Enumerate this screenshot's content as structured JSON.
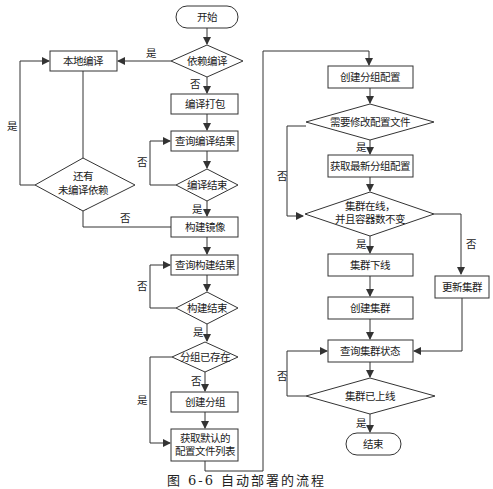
{
  "diagram": {
    "type": "flowchart",
    "caption": "图 6-6  自动部署的流程",
    "nodes": {
      "start": "开始",
      "dep_compile": "依赖编译",
      "local_compile": "本地编译",
      "compile_package": "编译打包",
      "query_compile": "查询编译结果",
      "compile_done": "编译结束",
      "more_deps_1": "还有",
      "more_deps_2": "未编译依赖",
      "build_image": "构建镜像",
      "query_build": "查询构建结果",
      "build_done": "构建结束",
      "group_exists": "分组已存在",
      "create_group": "创建分组",
      "get_default_1": "获取默认的",
      "get_default_2": "配置文件列表",
      "create_group_config": "创建分组配置",
      "need_modify": "需要修改配置文件",
      "get_latest_config": "获取最新分组配置",
      "cluster_online_1": "集群在线，",
      "cluster_online_2": "并且容器数不变",
      "cluster_offline": "集群下线",
      "create_cluster": "创建集群",
      "update_cluster": "更新集群",
      "query_cluster": "查询集群状态",
      "cluster_up": "集群已上线",
      "end": "结束"
    },
    "labels": {
      "yes": "是",
      "no": "否"
    }
  }
}
